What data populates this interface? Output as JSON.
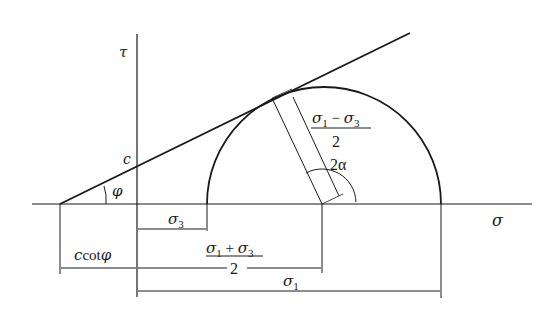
{
  "diagram": {
    "type": "Mohr-Coulomb failure envelope with Mohr circle",
    "axes": {
      "horizontal_label": "σ",
      "vertical_label": "τ"
    },
    "labels": {
      "cohesion": "c",
      "friction_angle": "φ",
      "sigma3": "σ",
      "sigma3_sub": "3",
      "sigma1": "σ",
      "sigma1_sub": "1",
      "radius_num_a": "σ",
      "radius_num_a_sub": "1",
      "radius_num_op": " − ",
      "radius_num_b": "σ",
      "radius_num_b_sub": "3",
      "radius_den": "2",
      "center_num_a": "σ",
      "center_num_a_sub": "1",
      "center_num_op": " + ",
      "center_num_b": "σ",
      "center_num_b_sub": "3",
      "center_den": "2",
      "angle_2alpha": "2α",
      "ccot_c": "c",
      "ccot_cot": "cot",
      "ccot_phi": "φ"
    },
    "colors": {
      "stroke": "#1a1a1a",
      "background": "#ffffff"
    }
  }
}
